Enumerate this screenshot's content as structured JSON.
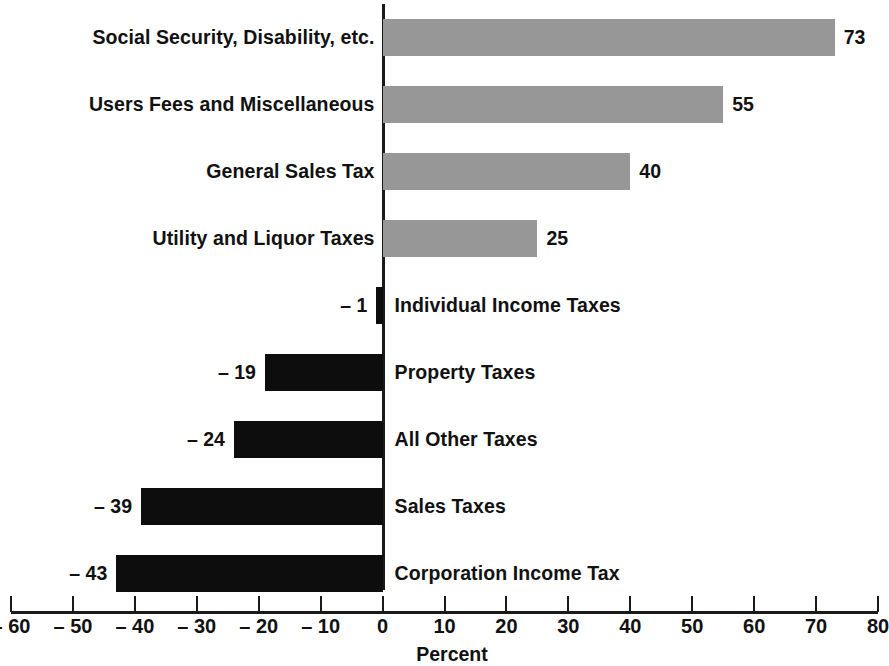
{
  "chart_data": {
    "type": "bar",
    "orientation": "horizontal",
    "title": "",
    "xlabel": "Percent",
    "ylabel": "",
    "xlim": [
      -60,
      80
    ],
    "grid": false,
    "legend": null,
    "tick_labels": [
      "– 60",
      "– 50",
      "– 40",
      "– 30",
      "– 20",
      "– 10",
      "0",
      "10",
      "20",
      "30",
      "40",
      "50",
      "60",
      "70",
      "80"
    ],
    "ticks": [
      -60,
      -50,
      -40,
      -30,
      -20,
      -10,
      0,
      10,
      20,
      30,
      40,
      50,
      60,
      70,
      80
    ],
    "categories": [
      "Social Security, Disability, etc.",
      "Users Fees and Miscellaneous",
      "General Sales Tax",
      "Utility and Liquor Taxes",
      "Individual Income Taxes",
      "Property Taxes",
      "All Other Taxes",
      "Sales Taxes",
      "Corporation Income Tax"
    ],
    "values": [
      73,
      55,
      40,
      25,
      -1,
      -19,
      -24,
      -39,
      -43
    ],
    "value_labels": [
      "73",
      "55",
      "40",
      "25",
      "– 1",
      "– 19",
      "– 24",
      "– 39",
      "– 43"
    ],
    "colors": {
      "positive_bar": "#979797",
      "negative_bar": "#0d0d0d",
      "axis": "#1a1a1a",
      "text": "#111111",
      "background": "#ffffff"
    }
  }
}
